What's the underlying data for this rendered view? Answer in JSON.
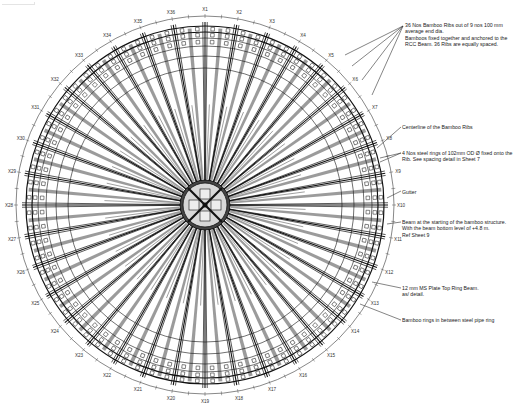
{
  "drawing": {
    "title": "Bamboo Rib Roof Plan",
    "center": {
      "x": 205,
      "y": 205
    },
    "rib_count": 36,
    "outer_radius": 183,
    "label_radius": 196,
    "hub_radius": 22,
    "colors": {
      "line": "#111111",
      "fill_band": "#7a7a7a",
      "ring": "#555555",
      "label": "#333333"
    }
  },
  "grid_labels": [
    "X1",
    "X2",
    "X3",
    "X4",
    "X5",
    "X6",
    "X7",
    "X8",
    "X9",
    "X10",
    "X11",
    "X12",
    "X13",
    "X14",
    "X15",
    "X16",
    "X17",
    "X18",
    "X19",
    "X20",
    "X21",
    "X22",
    "X23",
    "X24",
    "X25",
    "X26",
    "X27",
    "X28",
    "X29",
    "X30",
    "X31",
    "X32",
    "X33",
    "X34",
    "X35",
    "X36"
  ],
  "callouts": [
    {
      "id": "ribs",
      "lines": [
        "36 Nos Bamboo Ribs out of 9 nos 100 mm",
        "average end dia.",
        "Bamboos fixed together and anchored to the",
        "RCC Beam. 36 Ribs are equally spaced."
      ],
      "x": 405,
      "y": 22
    },
    {
      "id": "centerline",
      "lines": [
        "Centerline of the Bamboo Ribs"
      ],
      "x": 402,
      "y": 124
    },
    {
      "id": "steel-rings",
      "lines": [
        "4 Nos steel rings of 102mm OD Ø fixed onto the",
        "Rib. See spacing detail in Sheet 7"
      ],
      "x": 402,
      "y": 150
    },
    {
      "id": "gutter",
      "lines": [
        "Gutter"
      ],
      "x": 402,
      "y": 189
    },
    {
      "id": "beam",
      "lines": [
        "Beam at the starting of the bamboo structure.",
        "With the beam bottom level of +4.8 m.",
        "Ref Sheet 9"
      ],
      "x": 402,
      "y": 219
    },
    {
      "id": "top-ring",
      "lines": [
        "12 mm MS Plate Top Ring Beam.",
        "as/ detail."
      ],
      "x": 402,
      "y": 285
    },
    {
      "id": "bamboo-rings",
      "lines": [
        "Bamboo rings in between steel pipe ring"
      ],
      "x": 402,
      "y": 317
    }
  ],
  "leaders": [
    {
      "from": [
        403,
        26
      ],
      "to": [
        [
          345,
          55
        ],
        [
          352,
          66
        ],
        [
          362,
          80
        ],
        [
          372,
          95
        ]
      ]
    },
    {
      "from": [
        401,
        127
      ],
      "to": [
        [
          377,
          148
        ]
      ]
    },
    {
      "from": [
        401,
        153
      ],
      "to": [
        [
          380,
          158
        ],
        [
          380,
          162
        ]
      ]
    },
    {
      "from": [
        401,
        191
      ],
      "to": [
        [
          387,
          198
        ]
      ]
    },
    {
      "from": [
        401,
        222
      ],
      "to": [
        [
          387,
          224
        ]
      ]
    },
    {
      "from": [
        401,
        288
      ],
      "to": [
        [
          372,
          282
        ]
      ]
    },
    {
      "from": [
        401,
        320
      ],
      "to": [
        [
          360,
          304
        ]
      ]
    }
  ]
}
